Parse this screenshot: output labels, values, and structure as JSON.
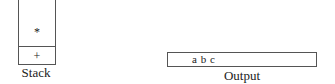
{
  "stack": {
    "label": "Stack",
    "items": [
      "*",
      "+"
    ]
  },
  "output": {
    "label": "Output",
    "value": "a b c"
  }
}
